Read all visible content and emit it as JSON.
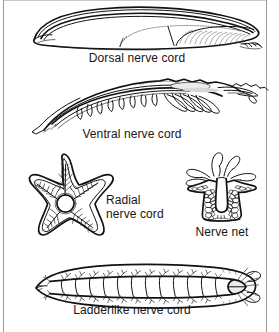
{
  "figure": {
    "background_color": "#ffffff",
    "ink_color": "#121212",
    "border_color": "#9a9a9a",
    "panel_count": 5
  },
  "panels": [
    {
      "id": "dorsal",
      "organism": "lancelet",
      "organism_icon": "lancelet-icon",
      "caption": "Dorsal nerve cord",
      "caption_align": "center",
      "nerve_structure": "dorsal hollow nerve cord running along the back above the notochord"
    },
    {
      "id": "ventral",
      "organism": "shrimp",
      "organism_icon": "shrimp-icon",
      "caption": "Ventral nerve cord",
      "caption_align": "center",
      "nerve_structure": "ventral nerve cord with segmental ganglia along the belly"
    },
    {
      "id": "radial",
      "organism": "sea star",
      "organism_icon": "sea-star-icon",
      "caption_line1": "Radial",
      "caption_line2": "nerve cord",
      "caption_align": "left",
      "nerve_structure": "nerve ring with five radial nerve cords branching into each arm"
    },
    {
      "id": "nerve-net",
      "organism": "hydra",
      "organism_icon": "hydra-icon",
      "caption": "Nerve net",
      "caption_align": "center",
      "nerve_structure": "diffuse meshwork of neurons with no central brain"
    },
    {
      "id": "ladderlike",
      "organism": "planarian",
      "organism_icon": "planarian-icon",
      "caption": "Ladderlike nerve cord",
      "caption_align": "center",
      "nerve_structure": "two longitudinal nerve cords joined by transverse commissures forming a ladder, with anterior cerebral ganglia"
    }
  ]
}
